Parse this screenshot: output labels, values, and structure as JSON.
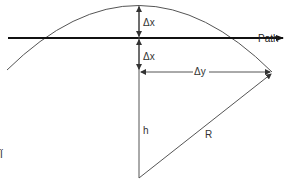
{
  "diagram": {
    "type": "geometry",
    "labels": {
      "delta_x_upper": "Δx",
      "delta_x_lower": "Δx",
      "delta_y": "Δy",
      "path": "Path",
      "height": "h",
      "radius": "R"
    },
    "colors": {
      "stroke": "#555555",
      "path_line": "#111111",
      "text": "#333333",
      "background": "#ffffff"
    }
  }
}
